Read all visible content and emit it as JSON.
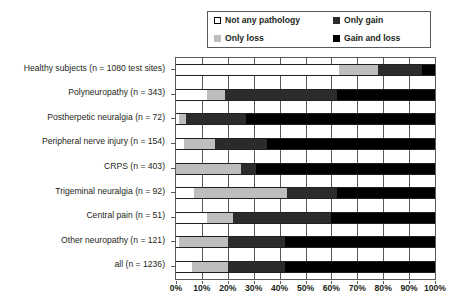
{
  "chart_data": {
    "type": "bar",
    "orientation": "horizontal",
    "stacked": true,
    "title": "",
    "xlabel": "",
    "ylabel": "",
    "xlim": [
      0,
      100
    ],
    "xticks": [
      "0%",
      "10%",
      "20%",
      "30%",
      "40%",
      "50%",
      "60%",
      "70%",
      "80%",
      "90%",
      "100%"
    ],
    "grid": true,
    "legend_position": "top-right",
    "categories": [
      "Healthy subjects (n = 1080 test sites)",
      "Polyneuropathy (n = 343)",
      "Postherpetic neuralgia (n = 72)",
      "Peripheral nerve injury (n = 154)",
      "CRPS (n = 403)",
      "Trigeminal neuralgia (n = 92)",
      "Central pain (n = 51)",
      "Other neuropathy (n = 121)",
      "all (n = 1236)"
    ],
    "series": [
      {
        "name": "Not any pathology",
        "color": "#ffffff",
        "values": [
          63,
          12,
          1,
          3,
          0,
          7,
          12,
          1,
          6
        ]
      },
      {
        "name": "Only loss",
        "color": "#bcbec0",
        "values": [
          15,
          7,
          3,
          12,
          25,
          36,
          10,
          19,
          14
        ]
      },
      {
        "name": "Only gain",
        "color": "#2b2b2b",
        "values": [
          17,
          43,
          23,
          20,
          6,
          19,
          38,
          22,
          22
        ]
      },
      {
        "name": "Gain and loss",
        "color": "#000000",
        "values": [
          5,
          38,
          73,
          65,
          69,
          38,
          40,
          58,
          58
        ]
      }
    ]
  },
  "legend": {
    "items": [
      {
        "label": "Not any pathology",
        "swatch": "none"
      },
      {
        "label": "Only gain",
        "swatch": "gain"
      },
      {
        "label": "Only loss",
        "swatch": "loss"
      },
      {
        "label": "Gain and loss",
        "swatch": "both"
      }
    ]
  },
  "colors": {
    "not_any_pathology": "#ffffff",
    "only_loss": "#bcbec0",
    "only_gain": "#2b2b2b",
    "gain_and_loss": "#000000",
    "axis": "#58595b",
    "text": "#231f20"
  }
}
